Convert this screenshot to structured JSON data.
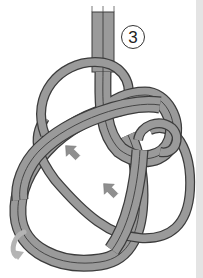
{
  "figure": {
    "step_number": "3",
    "rope_color": "#9a9a9a",
    "rope_outline_color": "#3c3c3c",
    "arrow_color": "#8f8f8f",
    "curved_arrow_color": "#b4b4b4",
    "side_strip_color": "#e4e4e4",
    "icons": [
      "diagonal-arrow-up-right",
      "diagonal-arrow-up-right",
      "curved-rotate-arrow"
    ]
  }
}
